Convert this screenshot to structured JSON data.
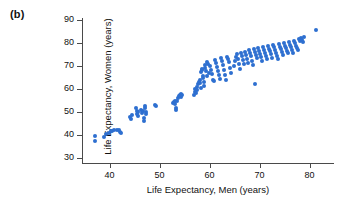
{
  "figure": {
    "panel_label": "(b)",
    "dot_color": "#2E6FD0",
    "axis_color": "#4a4a4a",
    "background": "#ffffff"
  },
  "chart_data": {
    "type": "scatter",
    "title": "",
    "xlabel": "Life Expectancy, Men (years)",
    "ylabel": "Life Expectancy, Women (years)",
    "xlim": [
      34.5,
      84.5
    ],
    "ylim": [
      28,
      91
    ],
    "xticks": [
      40,
      50,
      60,
      70,
      80
    ],
    "yticks": [
      30,
      40,
      50,
      60,
      70,
      80,
      90
    ],
    "grid": false,
    "legend": null,
    "marker": "circle",
    "marker_size_px": 4,
    "series": [
      {
        "name": "Countries",
        "color": "#2E6FD0",
        "points": [
          [
            37.0,
            39.8
          ],
          [
            37.1,
            37.4
          ],
          [
            38.8,
            39.4
          ],
          [
            39.2,
            40.6
          ],
          [
            39.9,
            41.0
          ],
          [
            40.2,
            42.1
          ],
          [
            40.4,
            41.8
          ],
          [
            40.8,
            42.2
          ],
          [
            41.4,
            42.3
          ],
          [
            41.9,
            42.2
          ],
          [
            42.1,
            41.6
          ],
          [
            42.2,
            41.2
          ],
          [
            44.0,
            48.0
          ],
          [
            44.2,
            47.3
          ],
          [
            44.4,
            49.0
          ],
          [
            45.3,
            52.1
          ],
          [
            45.4,
            50.5
          ],
          [
            45.5,
            49.4
          ],
          [
            45.6,
            48.6
          ],
          [
            45.7,
            50.0
          ],
          [
            46.3,
            51.0
          ],
          [
            46.4,
            49.6
          ],
          [
            46.6,
            50.4
          ],
          [
            46.8,
            47.4
          ],
          [
            46.9,
            46.2
          ],
          [
            47.0,
            52.9
          ],
          [
            47.1,
            51.8
          ],
          [
            47.2,
            50.3
          ],
          [
            47.3,
            49.2
          ],
          [
            49.1,
            53.2
          ],
          [
            49.3,
            52.8
          ],
          [
            52.6,
            53.9
          ],
          [
            52.8,
            54.3
          ],
          [
            53.0,
            55.0
          ],
          [
            53.1,
            53.6
          ],
          [
            53.2,
            52.0
          ],
          [
            53.3,
            51.2
          ],
          [
            53.4,
            54.8
          ],
          [
            53.6,
            56.4
          ],
          [
            53.8,
            57.0
          ],
          [
            54.0,
            57.4
          ],
          [
            54.2,
            56.8
          ],
          [
            54.3,
            58.0
          ],
          [
            54.5,
            57.6
          ],
          [
            56.8,
            57.6
          ],
          [
            57.0,
            59.0
          ],
          [
            57.1,
            60.2
          ],
          [
            57.2,
            58.4
          ],
          [
            57.4,
            61.0
          ],
          [
            57.5,
            59.8
          ],
          [
            57.6,
            62.2
          ],
          [
            57.8,
            63.4
          ],
          [
            58.0,
            64.0
          ],
          [
            58.1,
            62.6
          ],
          [
            58.2,
            60.6
          ],
          [
            58.3,
            67.6
          ],
          [
            58.4,
            68.2
          ],
          [
            58.5,
            68.8
          ],
          [
            58.6,
            66.0
          ],
          [
            58.7,
            64.8
          ],
          [
            58.8,
            63.0
          ],
          [
            58.9,
            61.4
          ],
          [
            59.0,
            70.6
          ],
          [
            59.1,
            69.4
          ],
          [
            59.2,
            68.0
          ],
          [
            59.4,
            65.6
          ],
          [
            59.5,
            72.0
          ],
          [
            59.6,
            71.2
          ],
          [
            59.8,
            67.0
          ],
          [
            60.0,
            70.0
          ],
          [
            60.2,
            68.6
          ],
          [
            60.4,
            66.6
          ],
          [
            60.6,
            64.2
          ],
          [
            60.8,
            63.6
          ],
          [
            61.0,
            72.6
          ],
          [
            61.2,
            71.4
          ],
          [
            61.4,
            69.8
          ],
          [
            61.6,
            67.8
          ],
          [
            61.8,
            66.2
          ],
          [
            62.0,
            64.6
          ],
          [
            62.2,
            73.8
          ],
          [
            62.4,
            72.2
          ],
          [
            62.6,
            70.4
          ],
          [
            62.8,
            68.4
          ],
          [
            63.0,
            66.4
          ],
          [
            63.2,
            64.0
          ],
          [
            63.4,
            74.0
          ],
          [
            63.6,
            73.4
          ],
          [
            63.8,
            71.8
          ],
          [
            64.0,
            69.2
          ],
          [
            64.2,
            67.2
          ],
          [
            64.8,
            70.2
          ],
          [
            65.0,
            72.4
          ],
          [
            65.2,
            74.2
          ],
          [
            65.4,
            75.2
          ],
          [
            65.6,
            73.0
          ],
          [
            65.8,
            71.0
          ],
          [
            66.0,
            69.0
          ],
          [
            66.2,
            76.0
          ],
          [
            66.4,
            74.6
          ],
          [
            66.6,
            72.8
          ],
          [
            66.8,
            70.8
          ],
          [
            67.0,
            76.4
          ],
          [
            67.2,
            75.0
          ],
          [
            67.4,
            73.2
          ],
          [
            67.6,
            71.6
          ],
          [
            67.8,
            77.0
          ],
          [
            68.0,
            75.6
          ],
          [
            68.2,
            74.4
          ],
          [
            68.4,
            72.4
          ],
          [
            68.6,
            70.6
          ],
          [
            68.8,
            77.4
          ],
          [
            69.0,
            76.2
          ],
          [
            69.2,
            74.8
          ],
          [
            69.4,
            73.6
          ],
          [
            69.0,
            62.3
          ],
          [
            69.6,
            78.0
          ],
          [
            69.8,
            76.8
          ],
          [
            70.0,
            75.4
          ],
          [
            70.2,
            74.0
          ],
          [
            70.4,
            72.2
          ],
          [
            70.6,
            78.4
          ],
          [
            70.8,
            77.2
          ],
          [
            71.0,
            76.0
          ],
          [
            71.2,
            74.6
          ],
          [
            71.4,
            73.4
          ],
          [
            71.6,
            78.8
          ],
          [
            71.8,
            77.6
          ],
          [
            72.0,
            76.6
          ],
          [
            72.2,
            75.2
          ],
          [
            72.4,
            73.8
          ],
          [
            72.6,
            79.2
          ],
          [
            72.8,
            78.2
          ],
          [
            73.0,
            77.0
          ],
          [
            73.2,
            75.8
          ],
          [
            73.4,
            74.4
          ],
          [
            73.6,
            73.2
          ],
          [
            73.8,
            79.6
          ],
          [
            74.0,
            78.6
          ],
          [
            74.2,
            77.4
          ],
          [
            74.4,
            76.2
          ],
          [
            74.6,
            75.0
          ],
          [
            74.8,
            80.2
          ],
          [
            75.0,
            79.0
          ],
          [
            75.2,
            78.0
          ],
          [
            75.4,
            76.8
          ],
          [
            75.6,
            75.6
          ],
          [
            75.8,
            80.6
          ],
          [
            76.0,
            79.4
          ],
          [
            76.2,
            78.4
          ],
          [
            76.4,
            77.2
          ],
          [
            76.6,
            76.0
          ],
          [
            76.8,
            81.0
          ],
          [
            77.0,
            80.0
          ],
          [
            77.2,
            79.0
          ],
          [
            77.4,
            78.0
          ],
          [
            77.6,
            77.0
          ],
          [
            77.8,
            81.8
          ],
          [
            78.0,
            80.8
          ],
          [
            78.2,
            82.2
          ],
          [
            78.4,
            81.4
          ],
          [
            78.6,
            80.4
          ],
          [
            78.8,
            82.6
          ],
          [
            81.3,
            86.0
          ]
        ]
      }
    ]
  }
}
